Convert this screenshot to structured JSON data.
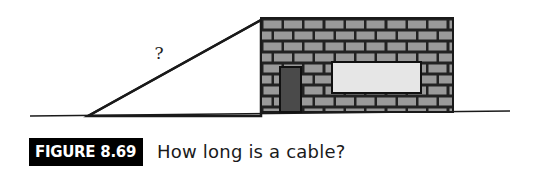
{
  "figure": {
    "label": "FIGURE 8.69",
    "caption": "How long is a cable?",
    "unknown_symbol": "?"
  },
  "diagram": {
    "elements": [
      "ground-line",
      "cable-line",
      "building-wall",
      "brick-pattern",
      "door",
      "window",
      "unknown-length-label"
    ],
    "colors": {
      "line": "#1a1a1a",
      "brick": "#9a9a9a",
      "mortar": "#222222",
      "door": "#4a4a4a",
      "window": "#e6e6e6",
      "label_bg": "#000000",
      "label_fg": "#ffffff"
    }
  }
}
